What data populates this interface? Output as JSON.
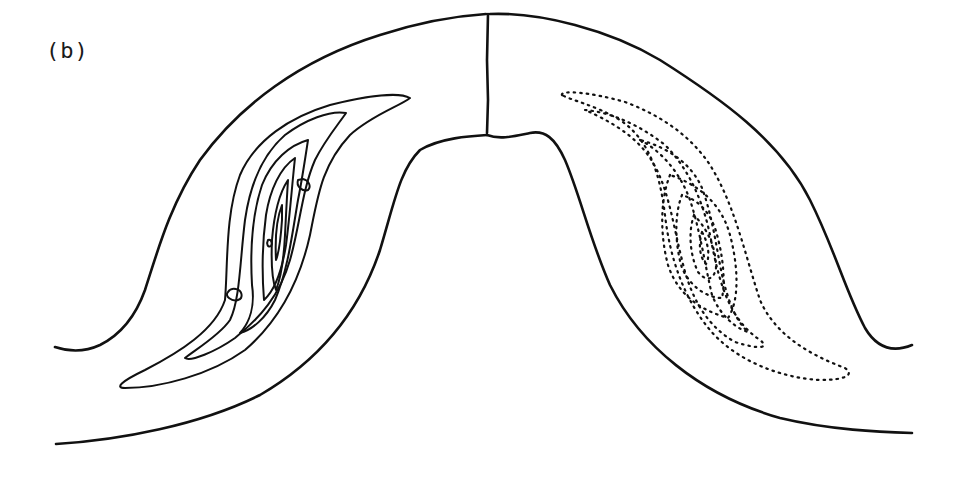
{
  "figure": {
    "panel_label": "(b)",
    "colors": {
      "background": "#ffffff",
      "line": "#111111"
    },
    "left_half": {
      "contour_style": "solid",
      "contour_count": 7
    },
    "right_half": {
      "contour_style": "dotted",
      "contour_count": 7
    }
  }
}
